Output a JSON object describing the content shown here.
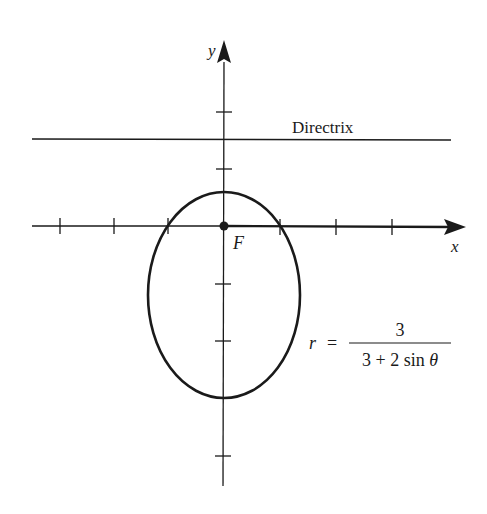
{
  "figure": {
    "type": "polar-conic-ellipse",
    "axes": {
      "x_label": "x",
      "y_label": "y",
      "origin_px": [
        224,
        226
      ],
      "unit_px": 57,
      "x_ticks": [
        -3,
        -2,
        -1,
        1,
        2,
        3
      ],
      "y_ticks": [
        2,
        1,
        -1,
        -2,
        -3,
        -4
      ]
    },
    "focus": {
      "label": "F",
      "at": [
        0,
        0
      ]
    },
    "directrix": {
      "label": "Directrix",
      "y": 1.5
    },
    "curve": {
      "equation_lhs": "r",
      "equation_eq": "=",
      "numerator": "3",
      "denominator": "3 + 2 sin θ",
      "eccentricity": 0.6667,
      "vertices": {
        "top_r": 0.6,
        "bottom_r": 3
      }
    },
    "colors": {
      "ink": "#1a1a1a",
      "background": "#ffffff"
    }
  }
}
